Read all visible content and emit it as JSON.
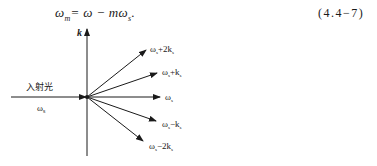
{
  "equation": {
    "text": "ωm = ω − mωs.",
    "lhs": "ω",
    "lhs_sub": "m",
    "rhs": "= ω − mω",
    "rhs_sub": "s",
    "end": ".",
    "number": "(4.4−7)"
  },
  "diagram": {
    "axis_label": "k",
    "incident_label": "入射光",
    "incident_freq": "ω",
    "incident_freq_sub": "s",
    "beams": [
      {
        "label_main": "ω",
        "label_sub": "s",
        "label_rest": "+2k",
        "label_rest_sub": "s"
      },
      {
        "label_main": "ω",
        "label_sub": "s",
        "label_rest": "+k",
        "label_rest_sub": "s"
      },
      {
        "label_main": "ω",
        "label_sub": "s",
        "label_rest": "",
        "label_rest_sub": ""
      },
      {
        "label_main": "ω",
        "label_sub": "s",
        "label_rest": "−k",
        "label_rest_sub": "s"
      },
      {
        "label_main": "ω",
        "label_sub": "s",
        "label_rest": "−2k",
        "label_rest_sub": "s"
      }
    ]
  }
}
